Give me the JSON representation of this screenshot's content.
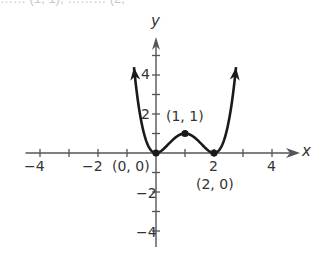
{
  "cropped_text_top": "…… (1, 1), ……… (2,",
  "chart_data": {
    "type": "line",
    "title": "",
    "function": "y = x^2 (x - 2)^2",
    "xlabel": "x",
    "ylabel": "y",
    "xlim": [
      -4.5,
      4.9
    ],
    "ylim": [
      -4.8,
      6.2
    ],
    "grid": false,
    "x_ticks": [
      -4,
      -3,
      -2,
      -1,
      1,
      2,
      3,
      4
    ],
    "x_tick_labels": [
      "-4",
      "-2",
      "2",
      "4"
    ],
    "y_ticks": [
      -4,
      -3,
      -2,
      -1,
      1,
      2,
      3,
      4,
      5
    ],
    "y_tick_labels": [
      "2",
      "4",
      "-2",
      "-4"
    ],
    "points": [
      {
        "x": 0,
        "y": 0,
        "label": "(0, 0)"
      },
      {
        "x": 1,
        "y": 1,
        "label": "(1, 1)"
      },
      {
        "x": 2,
        "y": 0,
        "label": "(2, 0)"
      }
    ],
    "series": [
      {
        "name": "f(x)",
        "x_range": [
          -0.76,
          2.76
        ],
        "end_arrows": true
      }
    ]
  },
  "labels": {
    "x_axis": "x",
    "y_axis": "y",
    "xtick_m4": "−4",
    "xtick_m2": "−2",
    "xtick_2": "2",
    "xtick_4": "4",
    "ytick_2": "2",
    "ytick_4": "4",
    "ytick_m2": "−2",
    "ytick_m4": "−4",
    "pt_origin": "(0, 0)",
    "pt_max": "(1, 1)",
    "pt_min2": "(2, 0)"
  },
  "colors": {
    "axis": "#555555",
    "curve": "#1a1a1a",
    "text": "#333333"
  }
}
